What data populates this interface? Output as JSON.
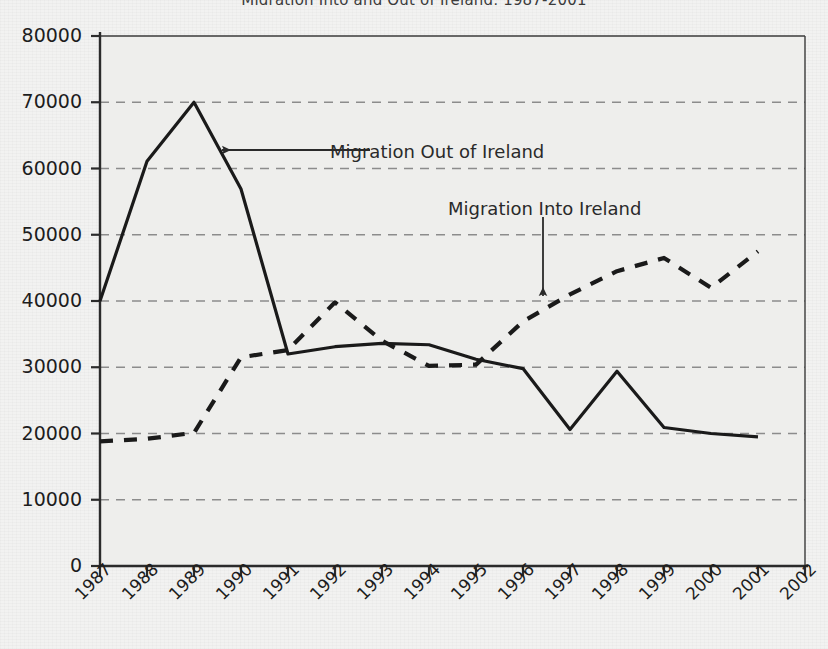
{
  "chart_data": {
    "type": "line",
    "title": "Migration Into and Out of Ireland, 1987-2001",
    "xlabel": "",
    "ylabel": "",
    "xlim": [
      1987,
      2002
    ],
    "ylim": [
      0,
      80000
    ],
    "grid": "horizontal-dashed",
    "legend_position": "inline-annotations",
    "x": [
      1987,
      1988,
      1989,
      1990,
      1991,
      1992,
      1993,
      1994,
      1995,
      1996,
      1997,
      1998,
      1999,
      2000,
      2001
    ],
    "series": [
      {
        "name": "Migration Out of Ireland",
        "style": "solid",
        "color": "#1a1a1a",
        "values": [
          40000,
          61100,
          70000,
          56900,
          32000,
          33100,
          33600,
          33400,
          31200,
          29800,
          20600,
          29400,
          20900,
          20000,
          19500
        ]
      },
      {
        "name": "Migration Into Ireland",
        "style": "dashed",
        "color": "#1a1a1a",
        "values": [
          18800,
          19200,
          20100,
          31500,
          32600,
          39800,
          34000,
          30200,
          30400,
          36900,
          41000,
          44500,
          46500,
          42000,
          47500
        ]
      }
    ],
    "y_ticks": [
      "0",
      "10000",
      "20000",
      "30000",
      "40000",
      "50000",
      "60000",
      "70000",
      "80000"
    ],
    "y_tick_values": [
      0,
      10000,
      20000,
      30000,
      40000,
      50000,
      60000,
      70000,
      80000
    ],
    "x_ticks": [
      "1987",
      "1988",
      "1989",
      "1990",
      "1991",
      "1992",
      "1993",
      "1994",
      "1995",
      "1996",
      "1997",
      "1998",
      "1999",
      "2000",
      "2001",
      "2002"
    ],
    "x_tick_values": [
      1987,
      1988,
      1989,
      1990,
      1991,
      1992,
      1993,
      1994,
      1995,
      1996,
      1997,
      1998,
      1999,
      2000,
      2001,
      2002
    ],
    "annotations": [
      {
        "label": "Migration Out of Ireland",
        "arrow": "left-arrow",
        "text_x": 330,
        "text_y": 143,
        "arrow_from_x": 370,
        "arrow_from_y": 150,
        "arrow_to_x": 222,
        "arrow_to_y": 150
      },
      {
        "label": "Migration Into Ireland",
        "arrow": "down-arrow",
        "text_x": 448,
        "text_y": 200,
        "arrow_from_x": 543,
        "arrow_from_y": 217,
        "arrow_to_x": 543,
        "arrow_to_y": 296
      }
    ],
    "axis_color": "#2b2b2b",
    "gridline_color": "#8c8c8c",
    "plot_background": "#eeeeec"
  },
  "geometry": {
    "plot_left": 100,
    "plot_right": 805,
    "plot_top": 36,
    "plot_bottom": 566
  }
}
